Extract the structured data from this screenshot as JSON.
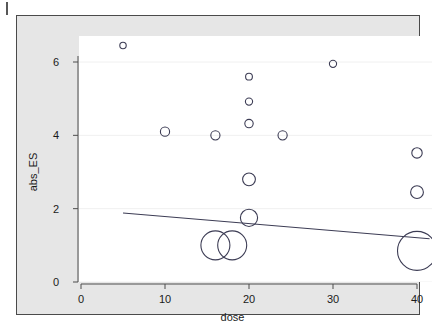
{
  "figure": {
    "background_color": "#ffffff",
    "panel_color": "#e6e6e6",
    "plot_background_color": "#ffffff",
    "point_color": "#3c3c54",
    "line_color": "#3c3c54",
    "grid_color": "#f0f0f0",
    "corner_mark": ""
  },
  "chart_data": {
    "type": "scatter",
    "title": "",
    "subtitle": "",
    "xlabel": "dose",
    "ylabel": "abs_ES",
    "xlim": [
      -1.5,
      42
    ],
    "ylim": [
      -0.5,
      6.9
    ],
    "xticks": [
      0,
      10,
      20,
      30,
      40
    ],
    "xticklabels": [
      "0",
      "10",
      "20",
      "30",
      "40"
    ],
    "yticks": [
      0,
      2,
      4,
      6
    ],
    "yticklabels": [
      "0",
      "2",
      "4",
      "6"
    ],
    "grid": true,
    "grid_axis": "y",
    "legend": null,
    "legend_position": "none",
    "annotations": [],
    "series": [
      {
        "name": "studies",
        "marker": "open-circle",
        "size_encodes": "study weight",
        "points": [
          {
            "x": 5,
            "y": 6.45,
            "r": 3.2
          },
          {
            "x": 30,
            "y": 5.95,
            "r": 3.6
          },
          {
            "x": 20,
            "y": 5.6,
            "r": 3.4
          },
          {
            "x": 20,
            "y": 4.92,
            "r": 3.6
          },
          {
            "x": 20,
            "y": 4.32,
            "r": 4.2
          },
          {
            "x": 10,
            "y": 4.1,
            "r": 4.6
          },
          {
            "x": 16,
            "y": 4.0,
            "r": 4.6
          },
          {
            "x": 24,
            "y": 4.0,
            "r": 4.6
          },
          {
            "x": 40,
            "y": 3.52,
            "r": 5.2
          },
          {
            "x": 20,
            "y": 2.8,
            "r": 6.4
          },
          {
            "x": 40,
            "y": 2.45,
            "r": 6.4
          },
          {
            "x": 20,
            "y": 1.75,
            "r": 8.6
          },
          {
            "x": 16,
            "y": 1.0,
            "r": 14.5
          },
          {
            "x": 18,
            "y": 1.0,
            "r": 14.5
          },
          {
            "x": 40,
            "y": 0.85,
            "r": 19.5
          }
        ]
      }
    ],
    "fit_line": {
      "name": "meta-regression line",
      "x_start": 5.0,
      "y_start": 1.88,
      "x_end": 41.5,
      "y_end": 1.18,
      "slope": -0.0192,
      "intercept": 1.976
    }
  }
}
